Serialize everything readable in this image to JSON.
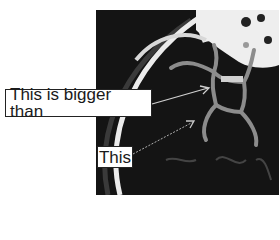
{
  "figure": {
    "background_color": "#141414",
    "vessel_color": "#8a8a8a",
    "bone_color": "#e8e8e8"
  },
  "annotations": [
    {
      "id": "bigger",
      "text": "This is bigger than"
    },
    {
      "id": "smaller",
      "text": "This"
    }
  ]
}
